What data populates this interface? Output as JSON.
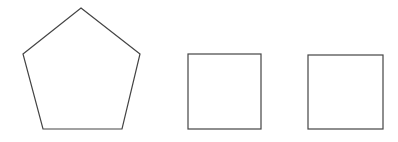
{
  "canvas": {
    "width": 398,
    "height": 142,
    "background": "#ffffff"
  },
  "stroke": {
    "color": "#444444",
    "width": 1.2
  },
  "shapes": [
    {
      "type": "polygon",
      "name": "pentagon",
      "points": [
        [
          81,
          8
        ],
        [
          140,
          54
        ],
        [
          122,
          129
        ],
        [
          43,
          129
        ],
        [
          23,
          54
        ]
      ]
    },
    {
      "type": "rect",
      "name": "square-1",
      "x": 188,
      "y": 54,
      "width": 73,
      "height": 75
    },
    {
      "type": "rect",
      "name": "square-2",
      "x": 308,
      "y": 55,
      "width": 75,
      "height": 74
    }
  ]
}
